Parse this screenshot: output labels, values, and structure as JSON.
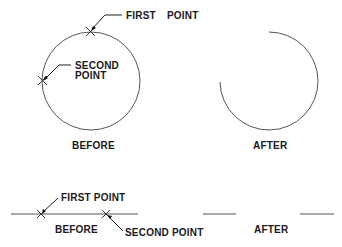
{
  "figure": {
    "top": {
      "before": {
        "caption": "BEFORE",
        "first_point_label": "FIRST",
        "first_point_label_2": "POINT",
        "second_point_label_line1": "SECOND",
        "second_point_label_line2": "POINT",
        "shape": "circle"
      },
      "after": {
        "caption": "AFTER",
        "shape": "arc"
      }
    },
    "bottom": {
      "before": {
        "caption": "BEFORE",
        "first_point_label": "FIRST POINT",
        "second_point_label": "SECOND POINT",
        "shape": "line"
      },
      "after": {
        "caption": "AFTER",
        "shape": "line-with-gap"
      }
    },
    "colors": {
      "stroke": "#555555",
      "text": "#1a1a1a",
      "background": "#ffffff"
    }
  }
}
